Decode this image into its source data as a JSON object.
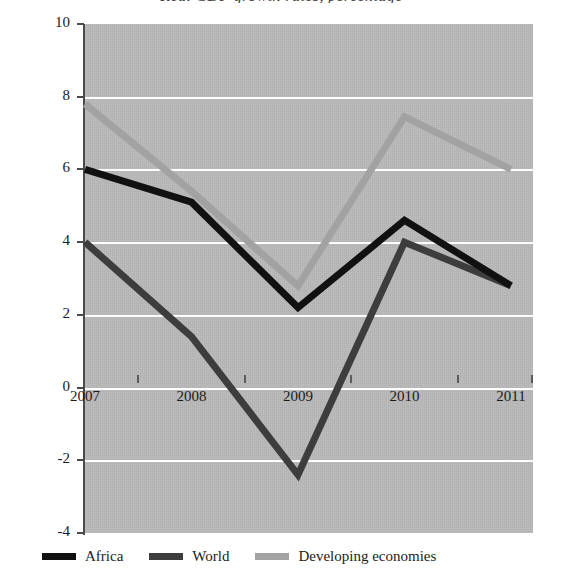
{
  "chart_data": {
    "type": "line",
    "title": "Real GDP growth rates, percentage",
    "xlabel": "",
    "ylabel": "",
    "categories": [
      "2007",
      "2008",
      "2009",
      "2010",
      "2011"
    ],
    "series": [
      {
        "name": "Africa",
        "color": "#111111",
        "values": [
          6.0,
          5.1,
          2.2,
          4.6,
          2.8
        ]
      },
      {
        "name": "World",
        "color": "#3d3d3d",
        "values": [
          4.0,
          1.4,
          -2.4,
          4.0,
          2.8
        ]
      },
      {
        "name": "Developing economies",
        "color": "#a2a2a2",
        "values": [
          7.8,
          5.4,
          2.8,
          7.45,
          6.0
        ]
      }
    ],
    "ylim": [
      -4,
      10
    ],
    "y_ticks": [
      10,
      8,
      6,
      4,
      2,
      0,
      -2,
      -4
    ],
    "y_tick_labels": [
      "10",
      "8",
      "6",
      "4",
      "2",
      "0",
      "-2",
      "-4"
    ],
    "grid": true,
    "grid_color": "#fdfdfd",
    "plot_background": "#b9b9b9",
    "legend_position": "bottom-left"
  },
  "legend": {
    "items": [
      {
        "label": "Africa"
      },
      {
        "label": "World"
      },
      {
        "label": "Developing economies"
      }
    ]
  }
}
